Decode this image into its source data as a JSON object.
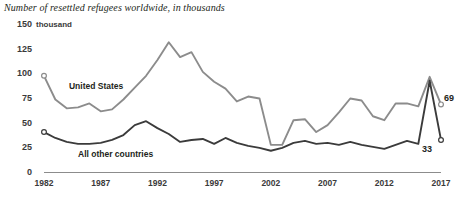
{
  "chart_data": {
    "type": "line",
    "title": "Number of resettled refugees worldwide, in thousands",
    "xlabel": "",
    "ylabel": "",
    "yunit": "thousand",
    "grid": false,
    "legend_position": "inline-labels",
    "xlim": [
      1982,
      2017
    ],
    "ylim": [
      0,
      150
    ],
    "yticks": [
      0,
      25,
      50,
      75,
      100,
      125,
      150
    ],
    "ytick_labels": [
      "0",
      "25",
      "50",
      "75",
      "100",
      "125",
      "150"
    ],
    "xticks": [
      1982,
      1987,
      1992,
      1997,
      2002,
      2007,
      2012,
      2017
    ],
    "xtick_labels": [
      "1982",
      "1987",
      "1992",
      "1997",
      "2002",
      "2007",
      "2012",
      "2017"
    ],
    "x": [
      1982,
      1983,
      1984,
      1985,
      1986,
      1987,
      1988,
      1989,
      1990,
      1991,
      1992,
      1993,
      1994,
      1995,
      1996,
      1997,
      1998,
      1999,
      2000,
      2001,
      2002,
      2003,
      2004,
      2005,
      2006,
      2007,
      2008,
      2009,
      2010,
      2011,
      2012,
      2013,
      2014,
      2015,
      2016,
      2017
    ],
    "series": [
      {
        "name": "United States",
        "color": "#8c8c8c",
        "label_x": 1984.2,
        "label_y": 88,
        "end_label": "69",
        "start_marker": true,
        "end_marker": true,
        "values": [
          98,
          74,
          65,
          66,
          70,
          62,
          64,
          74,
          86,
          98,
          114,
          132,
          117,
          122,
          102,
          92,
          85,
          72,
          77,
          75,
          28,
          28,
          53,
          54,
          41,
          48,
          61,
          75,
          73,
          57,
          53,
          70,
          70,
          67,
          97,
          69
        ]
      },
      {
        "name": "All other countries",
        "color": "#3b3b3b",
        "label_x": 1985.0,
        "label_y": 19,
        "end_label": "33",
        "start_marker": true,
        "end_marker": true,
        "values": [
          41,
          35,
          31,
          29,
          29,
          30,
          33,
          38,
          48,
          52,
          45,
          39,
          31,
          33,
          34,
          29,
          35,
          30,
          27,
          25,
          22,
          25,
          30,
          32,
          29,
          30,
          28,
          31,
          28,
          26,
          24,
          28,
          32,
          29,
          93,
          33
        ]
      }
    ],
    "annotations": [
      {
        "text": "69",
        "series": "United States",
        "x": 2017,
        "y": 69
      },
      {
        "text": "33",
        "series": "All other countries",
        "x": 2017,
        "y": 33
      }
    ]
  }
}
